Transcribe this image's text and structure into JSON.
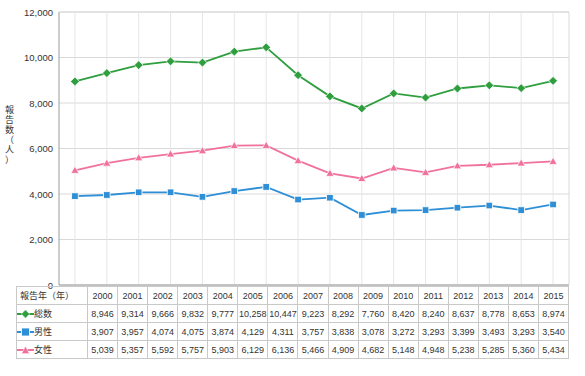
{
  "chart_data": {
    "type": "line",
    "title": "",
    "xlabel": "報告年（年）",
    "ylabel": "報告数（人）",
    "categories": [
      "2000",
      "2001",
      "2002",
      "2003",
      "2004",
      "2005",
      "2006",
      "2007",
      "2008",
      "2009",
      "2010",
      "2011",
      "2012",
      "2013",
      "2014",
      "2015"
    ],
    "ylim": [
      0,
      12000
    ],
    "yticks": [
      "0",
      "2,000",
      "4,000",
      "6,000",
      "8,000",
      "10,000",
      "12,000"
    ],
    "grid": true,
    "legend_position": "table-row-headers",
    "series": [
      {
        "name": "総数",
        "color": "#2e9e3e",
        "marker": "diamond",
        "values": [
          8946,
          9314,
          9666,
          9832,
          9777,
          10258,
          10447,
          9223,
          8292,
          7760,
          8420,
          8240,
          8637,
          8778,
          8653,
          8974
        ],
        "labels": [
          "8,946",
          "9,314",
          "9,666",
          "9,832",
          "9,777",
          "10,258",
          "10,447",
          "9,223",
          "8,292",
          "7,760",
          "8,420",
          "8,240",
          "8,637",
          "8,778",
          "8,653",
          "8,974"
        ]
      },
      {
        "name": "男性",
        "color": "#2e8fd6",
        "marker": "square",
        "values": [
          3907,
          3957,
          4074,
          4075,
          3874,
          4129,
          4311,
          3757,
          3838,
          3078,
          3272,
          3293,
          3399,
          3493,
          3293,
          3540
        ],
        "labels": [
          "3,907",
          "3,957",
          "4,074",
          "4,075",
          "3,874",
          "4,129",
          "4,311",
          "3,757",
          "3,838",
          "3,078",
          "3,272",
          "3,293",
          "3,399",
          "3,493",
          "3,293",
          "3,540"
        ]
      },
      {
        "name": "女性",
        "color": "#f0729c",
        "marker": "triangle",
        "values": [
          5039,
          5357,
          5592,
          5757,
          5903,
          6129,
          6136,
          5466,
          4909,
          4682,
          5148,
          4948,
          5238,
          5285,
          5360,
          5434
        ],
        "labels": [
          "5,039",
          "5,357",
          "5,592",
          "5,757",
          "5,903",
          "6,129",
          "6,136",
          "5,466",
          "4,909",
          "4,682",
          "5,148",
          "4,948",
          "5,238",
          "5,285",
          "5,360",
          "5,434"
        ]
      }
    ]
  },
  "table": {
    "header_label": "報告年（年）",
    "columns": [
      "2000",
      "2001",
      "2002",
      "2003",
      "2004",
      "2005",
      "2006",
      "2007",
      "2008",
      "2009",
      "2010",
      "2011",
      "2012",
      "2013",
      "2014",
      "2015"
    ]
  }
}
